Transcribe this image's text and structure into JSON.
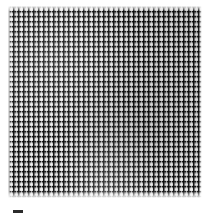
{
  "figure": {
    "kind": "micrograph",
    "background_color": "#ffffff",
    "caption": ""
  },
  "mesh": {
    "description": "dense square-cell woven lattice filling the frame",
    "ground_color": "#b9b9b9",
    "fiber_dark_color": "#0a0a0a",
    "fiber_light_color": "#fafafa",
    "cell_period_px": 5,
    "block": {
      "left_px": 8,
      "top_px": 6,
      "width_px": 194,
      "height_px": 192
    }
  },
  "scale_bar": {
    "color": "#2b2b2b",
    "left_px": 13,
    "top_px": 210,
    "width_px": 10,
    "height_px": 3,
    "label": ""
  }
}
